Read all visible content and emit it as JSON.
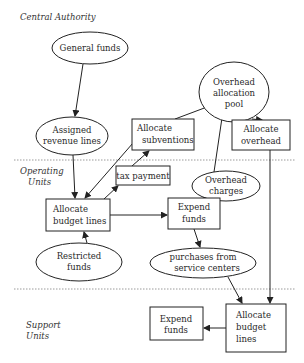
{
  "diagram": {
    "colors": {
      "stroke": "#222222",
      "text": "#2a2a2a",
      "divider": "#9a9a9a",
      "background": "#ffffff"
    },
    "tiers": [
      {
        "id": "central",
        "lines": [
          "Central Authority"
        ]
      },
      {
        "id": "operating",
        "lines": [
          "Operating",
          "Units"
        ]
      },
      {
        "id": "support",
        "lines": [
          "Support",
          "Units"
        ]
      }
    ],
    "nodes": {
      "general_funds": {
        "shape": "ellipse",
        "lines": [
          "General funds"
        ]
      },
      "assigned_revenue_lines": {
        "shape": "ellipse",
        "lines": [
          "Assigned",
          "revenue lines"
        ]
      },
      "allocate_subventions": {
        "shape": "box",
        "lines": [
          "Allocate",
          "subventions"
        ]
      },
      "overhead_allocation_pool": {
        "shape": "ellipse",
        "lines": [
          "Overhead",
          "allocation",
          "pool"
        ]
      },
      "allocate_overhead": {
        "shape": "box",
        "lines": [
          "Allocate",
          "overhead"
        ]
      },
      "tax_payment": {
        "shape": "box",
        "lines": [
          "tax payment"
        ]
      },
      "overhead_charges": {
        "shape": "ellipse",
        "lines": [
          "Overhead",
          "charges"
        ]
      },
      "allocate_budget_lines_op": {
        "shape": "box",
        "lines": [
          "Allocate",
          "budget lines"
        ]
      },
      "expend_funds_op": {
        "shape": "box",
        "lines": [
          "Expend",
          "funds"
        ]
      },
      "restricted_funds": {
        "shape": "ellipse",
        "lines": [
          "Restricted",
          "funds"
        ]
      },
      "purchases_service_centers": {
        "shape": "ellipse",
        "lines": [
          "purchases from",
          "service centers"
        ]
      },
      "expend_funds_support": {
        "shape": "box",
        "lines": [
          "Expend",
          "funds"
        ]
      },
      "allocate_budget_lines_support": {
        "shape": "box",
        "lines": [
          "Allocate",
          "budget",
          "lines"
        ]
      }
    },
    "edges": [
      {
        "from": "General funds",
        "to": "Assigned revenue lines"
      },
      {
        "from": "Assigned revenue lines",
        "to": "Allocate budget lines"
      },
      {
        "from": "Allocate subventions",
        "to": "Allocate budget lines"
      },
      {
        "from": "Allocate budget lines",
        "to": "tax payment"
      },
      {
        "from": "tax payment",
        "to": "Allocate subventions"
      },
      {
        "from": "Allocate subventions",
        "to": "Overhead allocation pool"
      },
      {
        "from": "Overhead charges",
        "to": "Overhead allocation pool"
      },
      {
        "from": "Overhead allocation pool",
        "to": "Allocate overhead"
      },
      {
        "from": "Allocate budget lines",
        "to": "Expend funds"
      },
      {
        "from": "Expend funds",
        "to": "Overhead charges"
      },
      {
        "from": "Expend funds",
        "to": "purchases from service centers"
      },
      {
        "from": "Restricted funds",
        "to": "Allocate budget lines"
      },
      {
        "from": "purchases from service centers",
        "to": "Allocate budget lines (Support Units)"
      },
      {
        "from": "Allocate overhead",
        "to": "Allocate budget lines (Support Units)"
      },
      {
        "from": "Allocate budget lines (Support Units)",
        "to": "Expend funds (Support Units)"
      }
    ]
  }
}
